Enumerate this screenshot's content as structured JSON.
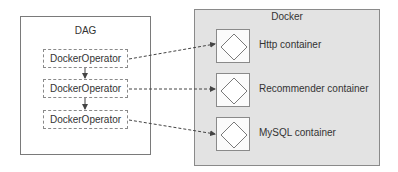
{
  "dag": {
    "title": "DAG",
    "operators": [
      {
        "label": "DockerOperator"
      },
      {
        "label": "DockerOperator"
      },
      {
        "label": "DockerOperator"
      }
    ]
  },
  "docker": {
    "title": "Docker",
    "containers": [
      {
        "label": "Http container",
        "icon": "diamond-icon"
      },
      {
        "label": "Recommender container",
        "icon": "diamond-icon"
      },
      {
        "label": "MySQL container",
        "icon": "diamond-icon"
      }
    ]
  },
  "colors": {
    "docker_bg": "#e3e3e3",
    "border": "#8a8a8a",
    "arrow": "#444444"
  }
}
